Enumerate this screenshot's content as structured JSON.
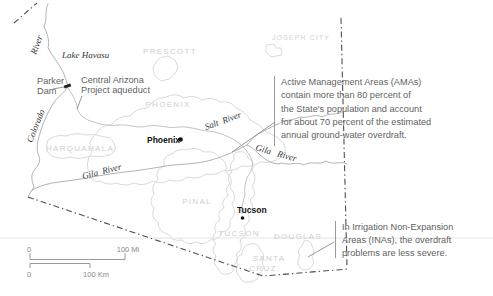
{
  "colors": {
    "background": "#ffffff",
    "region_outline": "#dadada",
    "region_label": "#cfcfcf",
    "river": "#b3b3b3",
    "state_border": "#4f4f4f",
    "annotation_text": "#5f5f5f",
    "city_text": "#111111",
    "scale_text": "#888888"
  },
  "water_labels": {
    "lake_havasu": "Lake Havasu",
    "colorado_river_upper": "River",
    "colorado_river_lower": "Colorado",
    "salt_river": "Salt  River",
    "gila_river_west": "Gila  River",
    "gila_river_east": "Gila   River"
  },
  "feature_labels": {
    "parker_dam_line1": "Parker",
    "parker_dam_line2": "Dam",
    "aqueduct_line1": "Central Arizona",
    "aqueduct_line2": "Project aqueduct"
  },
  "region_labels": {
    "prescott": "PRESCOTT",
    "joseph_city": "JOSEPH CITY",
    "phoenix_ama": "PHOENIX",
    "harquahala": "HARQUAHALA",
    "pinal": "PINAL",
    "tucson_ama": "TUCSON",
    "douglas": "DOUGLAS",
    "santa_cruz_line1": "SANTA",
    "santa_cruz_line2": "CRUZ"
  },
  "cities": {
    "phoenix": "Phoenix",
    "tucson": "Tucson"
  },
  "annotations": {
    "ama": {
      "line1": "Active Management Areas (AMAs)",
      "line2": "contain more than 80 percent of",
      "line3": "the State's population and account",
      "line4": "for about 70 percent of the estimated",
      "line5": "annual ground-water overdraft."
    },
    "ina": {
      "line1": "In Irrigation Non-Expansion",
      "line2": "Areas (INAs), the overdraft",
      "line3": "problems are less severe."
    }
  },
  "scale_bar": {
    "mi_zero": "0",
    "mi_max": "100 Mi",
    "km_zero": "0",
    "km_max": "100 Km"
  }
}
